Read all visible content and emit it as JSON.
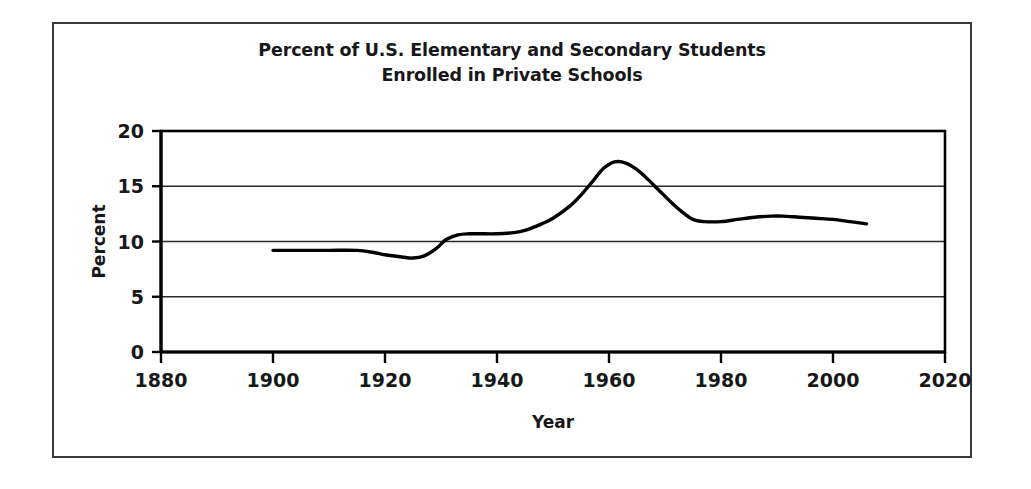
{
  "figure": {
    "title_line_1": "Percent of U.S. Elementary and Secondary Students",
    "title_line_2": "Enrolled in Private Schools",
    "title": "Percent of U.S. Elementary and Secondary Students\nEnrolled in Private Schools",
    "border_color": "#3a3a3c",
    "background_color": "#ffffff",
    "line_color": "#000000",
    "gridline_color": "#2b2b2d",
    "axis_color": "#000000"
  },
  "chart_data": {
    "type": "line",
    "title": "Percent of U.S. Elementary and Secondary Students Enrolled in Private Schools",
    "xlabel": "Year",
    "ylabel": "Percent",
    "xlim": [
      1880,
      2020
    ],
    "ylim": [
      0,
      20
    ],
    "xticks": [
      1880,
      1900,
      1920,
      1940,
      1960,
      1980,
      2000,
      2020
    ],
    "yticks": [
      0,
      5,
      10,
      15,
      20
    ],
    "xtick_labels": [
      "1880",
      "1900",
      "1920",
      "1940",
      "1960",
      "1980",
      "2000",
      "2020"
    ],
    "ytick_labels": [
      "0",
      "5",
      "10",
      "15",
      "20"
    ],
    "grid": "horizontal",
    "legend": "none",
    "series": [
      {
        "name": "Percent enrolled in private schools",
        "x": [
          1900,
          1905,
          1910,
          1915,
          1918,
          1920,
          1923,
          1925,
          1927,
          1929,
          1931,
          1933,
          1935,
          1937,
          1940,
          1943,
          1945,
          1948,
          1950,
          1953,
          1955,
          1957,
          1959,
          1961,
          1963,
          1965,
          1967,
          1969,
          1971,
          1973,
          1975,
          1977,
          1980,
          1983,
          1986,
          1989,
          1991,
          1994,
          1997,
          2000,
          2003,
          2006
        ],
        "values": [
          9.2,
          9.2,
          9.2,
          9.2,
          9.0,
          8.8,
          8.6,
          8.5,
          8.7,
          9.3,
          10.2,
          10.6,
          10.7,
          10.7,
          10.7,
          10.8,
          11.0,
          11.6,
          12.1,
          13.2,
          14.2,
          15.4,
          16.6,
          17.2,
          17.1,
          16.5,
          15.6,
          14.6,
          13.6,
          12.7,
          12.0,
          11.8,
          11.8,
          12.0,
          12.2,
          12.3,
          12.3,
          12.2,
          12.1,
          12.0,
          11.8,
          11.6
        ]
      }
    ]
  }
}
